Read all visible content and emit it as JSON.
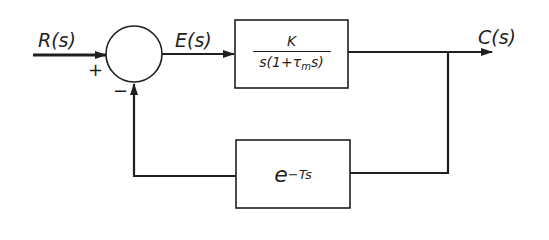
{
  "diagram": {
    "type": "feedback control block diagram",
    "colors": {
      "stroke": "#1f1f1f",
      "background": "#ffffff"
    },
    "signals": {
      "input": "R(s)",
      "error": "E(s)",
      "output": "C(s)"
    },
    "summing_junction": {
      "plus_sign": "+",
      "minus_sign": "−"
    },
    "forward_block": {
      "numerator": "K",
      "denominator_prefix": "s(1+τ",
      "denominator_subscript": "m",
      "denominator_suffix": "s)"
    },
    "feedback_block": {
      "base": "e",
      "exponent": "−Ts"
    }
  }
}
